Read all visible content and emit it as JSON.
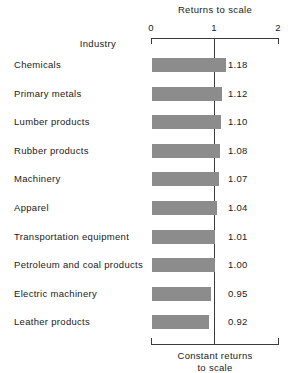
{
  "chart_data": {
    "type": "bar",
    "orientation": "horizontal",
    "title": "Returns to scale",
    "xlabel": "Returns to scale",
    "ylabel": "Industry",
    "xlim": [
      0,
      2
    ],
    "xticks": [
      "0",
      "1",
      "2"
    ],
    "grid": false,
    "legend": null,
    "categories": [
      "Chemicals",
      "Primary metals",
      "Lumber products",
      "Rubber products",
      "Machinery",
      "Apparel",
      "Transportation equipment",
      "Petroleum and coal products",
      "Electric machinery",
      "Leather products"
    ],
    "values": [
      1.18,
      1.12,
      1.1,
      1.08,
      1.07,
      1.04,
      1.01,
      1.0,
      0.95,
      0.92
    ],
    "value_labels": [
      "1.18",
      "1.12",
      "1.10",
      "1.08",
      "1.07",
      "1.04",
      "1.01",
      "1.00",
      "0.95",
      "0.92"
    ],
    "annotations": [
      {
        "text_line1": "Constant returns",
        "text_line2": "to scale",
        "at_x": 1.0
      }
    ],
    "colors": {
      "bar": "#8c8c8c",
      "axis": "#3a3a3a",
      "text": "#1a1a1a",
      "background": "#ffffff"
    }
  },
  "axis": {
    "title": "Returns to scale",
    "ticks": [
      {
        "label": "0"
      },
      {
        "label": "1"
      },
      {
        "label": "2"
      }
    ]
  },
  "table": {
    "header": "Industry",
    "rows": [
      {
        "label": "Chemicals",
        "value": "1.18"
      },
      {
        "label": "Primary metals",
        "value": "1.12"
      },
      {
        "label": "Lumber products",
        "value": "1.10"
      },
      {
        "label": "Rubber products",
        "value": "1.08"
      },
      {
        "label": "Machinery",
        "value": "1.07"
      },
      {
        "label": "Apparel",
        "value": "1.04"
      },
      {
        "label": "Transportation equipment",
        "value": "1.01"
      },
      {
        "label": "Petroleum and coal products",
        "value": "1.00"
      },
      {
        "label": "Electric machinery",
        "value": "0.95"
      },
      {
        "label": "Leather products",
        "value": "0.92"
      }
    ]
  },
  "footnote": {
    "line1": "Constant returns",
    "line2": "to scale"
  }
}
